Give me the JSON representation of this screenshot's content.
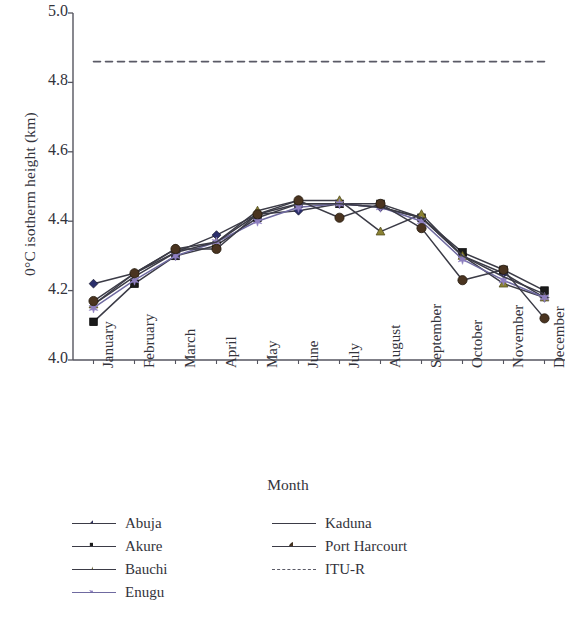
{
  "chart_data": {
    "type": "line",
    "title": "",
    "xlabel": "Month",
    "ylabel": "0°C isotherm height (km)",
    "ylim": [
      4.0,
      5.0
    ],
    "yticks": [
      "5.0",
      "4.8",
      "4.6",
      "4.4",
      "4.2",
      "4.0"
    ],
    "ytick_values": [
      5.0,
      4.8,
      4.6,
      4.4,
      4.2,
      4.0
    ],
    "grid": false,
    "legend_position": "below-axes",
    "categories": [
      "January",
      "February",
      "March",
      "April",
      "May",
      "June",
      "July",
      "August",
      "September",
      "October",
      "November",
      "December"
    ],
    "series": [
      {
        "name": "Abuja",
        "marker": "diamond",
        "color": "#2b2f6b",
        "line_color": "#3b3b46",
        "values": [
          4.22,
          4.25,
          4.31,
          4.36,
          4.42,
          4.43,
          4.45,
          4.44,
          4.41,
          4.3,
          4.25,
          4.18
        ]
      },
      {
        "name": "Akure",
        "marker": "square",
        "color": "#1a1a1a",
        "line_color": "#3b3b46",
        "values": [
          4.11,
          4.22,
          4.3,
          4.33,
          4.41,
          4.45,
          4.45,
          4.45,
          4.41,
          4.31,
          4.26,
          4.2
        ]
      },
      {
        "name": "Bauchi",
        "marker": "triangle",
        "color": "#8a8233",
        "line_color": "#3b3b46",
        "values": [
          4.16,
          4.25,
          4.32,
          4.34,
          4.43,
          4.46,
          4.46,
          4.37,
          4.42,
          4.3,
          4.22,
          4.18
        ]
      },
      {
        "name": "Enugu",
        "marker": "star",
        "color": "#8e7fc0",
        "line_color": "#6f6aa0",
        "values": [
          4.15,
          4.23,
          4.3,
          4.34,
          4.4,
          4.44,
          4.45,
          4.44,
          4.4,
          4.29,
          4.23,
          4.18
        ]
      },
      {
        "name": "Kaduna",
        "marker": "none",
        "color": "#3b3b46",
        "line_color": "#3b3b46",
        "values": [
          4.16,
          4.24,
          4.31,
          4.34,
          4.42,
          4.45,
          4.45,
          4.44,
          4.41,
          4.3,
          4.24,
          4.19
        ]
      },
      {
        "name": "Port Harcourt",
        "marker": "circle",
        "color": "#4a3420",
        "line_color": "#3b3b46",
        "values": [
          4.17,
          4.25,
          4.32,
          4.32,
          4.42,
          4.46,
          4.41,
          4.45,
          4.38,
          4.23,
          4.26,
          4.12
        ]
      },
      {
        "name": "ITU-R",
        "marker": "none",
        "style": "dashed",
        "color": "#5a5a66",
        "line_color": "#5a5a66",
        "constant": 4.86,
        "values": [
          4.86,
          4.86,
          4.86,
          4.86,
          4.86,
          4.86,
          4.86,
          4.86,
          4.86,
          4.86,
          4.86,
          4.86
        ]
      }
    ]
  },
  "legend": {
    "column_one": [
      "Abuja",
      "Akure",
      "Bauchi",
      "Enugu"
    ],
    "column_two": [
      "Kaduna",
      "Port Harcourt",
      "ITU-R"
    ]
  }
}
